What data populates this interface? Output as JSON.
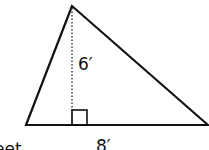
{
  "diagram": {
    "shape": "triangle",
    "height_label": "6′",
    "base_label": "8′",
    "partial_caption": "feet",
    "right_angle_marker": true,
    "height_line_style": "dotted",
    "stroke_color": "#111111",
    "background_color": "#ffffff"
  }
}
